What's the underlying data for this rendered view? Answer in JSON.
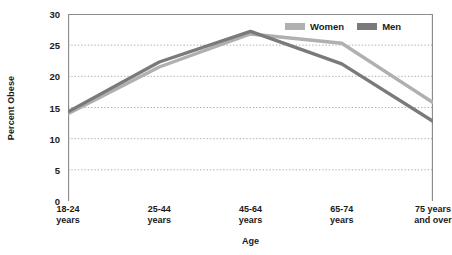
{
  "chart_data": {
    "type": "line",
    "title": "",
    "xlabel": "Age",
    "ylabel": "Percent Obese",
    "categories": [
      "18-24\nyears",
      "25-44\nyears",
      "45-64\nyears",
      "65-74\nyears",
      "75 years\nand over"
    ],
    "category_lines": [
      [
        "18-24",
        "years"
      ],
      [
        "25-44",
        "years"
      ],
      [
        "45-64",
        "years"
      ],
      [
        "65-74",
        "years"
      ],
      [
        "75 years",
        "and over"
      ]
    ],
    "series": [
      {
        "name": "Women",
        "color": "#b0b0b0",
        "values": [
          14.0,
          21.5,
          26.8,
          25.3,
          15.8
        ]
      },
      {
        "name": "Men",
        "color": "#7a7a7a",
        "values": [
          14.3,
          22.3,
          27.2,
          22.0,
          12.8
        ]
      }
    ],
    "ylim": [
      0,
      30
    ],
    "yticks": [
      0,
      5,
      10,
      15,
      20,
      25,
      30
    ],
    "ytick_labels": [
      "0",
      "5",
      "10",
      "15",
      "20",
      "25",
      "30"
    ],
    "grid": "horizontal-dotted",
    "legend_position": "top-right",
    "axis_color": "#8c8c8c",
    "gridline_color": "#9a9a9a",
    "background": "#ffffff"
  },
  "legend": {
    "entries": [
      {
        "label": "Women",
        "swatch_name": "legend-swatch-women"
      },
      {
        "label": "Men",
        "swatch_name": "legend-swatch-men"
      }
    ]
  }
}
